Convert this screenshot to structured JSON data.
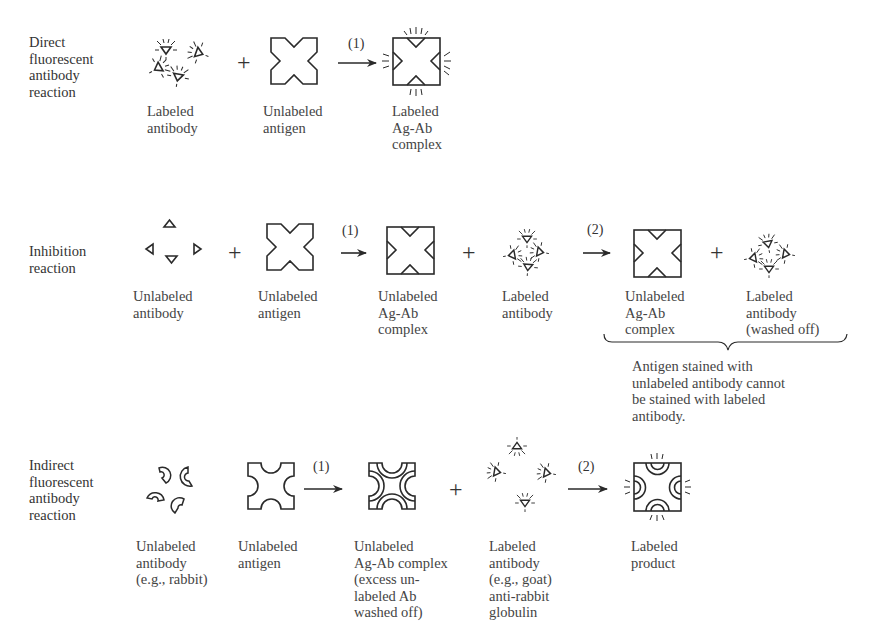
{
  "rows": [
    {
      "id": "direct",
      "label": "Direct\nfluorescent\nantibody\nreaction",
      "items": [
        {
          "label": "Labeled\nantibody"
        },
        {
          "label": "Unlabeled\nantigen"
        },
        {
          "label": "Labeled\nAg-Ab\ncomplex"
        }
      ],
      "steps": [
        "(1)"
      ]
    },
    {
      "id": "inhibition",
      "label": "Inhibition\nreaction",
      "items": [
        {
          "label": "Unlabeled\nantibody"
        },
        {
          "label": "Unlabeled\nantigen"
        },
        {
          "label": "Unlabeled\nAg-Ab\ncomplex"
        },
        {
          "label": "Labeled\nantibody"
        },
        {
          "label": "Unlabeled\nAg-Ab\ncomplex"
        },
        {
          "label": "Labeled\nantibody\n(washed off)"
        }
      ],
      "steps": [
        "(1)",
        "(2)"
      ],
      "note": "Antigen stained with\nunlabeled antibody cannot\nbe stained with labeled\nantibody."
    },
    {
      "id": "indirect",
      "label": "Indirect\nfluorescent\nantibody\nreaction",
      "items": [
        {
          "label": "Unlabeled\nantibody\n(e.g., rabbit)"
        },
        {
          "label": "Unlabeled\nantigen"
        },
        {
          "label": "Unlabeled\nAg-Ab complex\n(excess un-\nlabeled Ab\nwashed off)"
        },
        {
          "label": "Labeled\nantibody\n(e.g., goat)\nanti-rabbit\nglobulin"
        },
        {
          "label": "Labeled\nproduct"
        }
      ],
      "steps": [
        "(1)",
        "(2)"
      ]
    }
  ],
  "symbols": {
    "plus": "+"
  },
  "icons": {
    "labeled_antibody": "triangle-with-rays",
    "unlabeled_antibody": "triangle",
    "antigen": "notched-square",
    "rabbit_antibody": "crescent",
    "arrow": "right-arrow",
    "brace": "curly-brace"
  }
}
